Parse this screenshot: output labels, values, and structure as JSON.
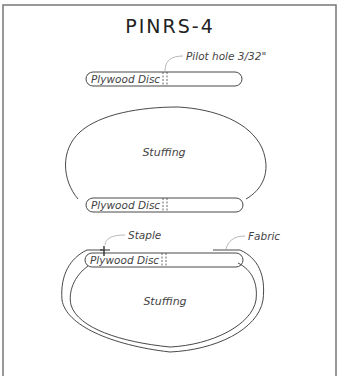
{
  "title": "PINRS-4",
  "figure_1": {
    "disc_label": "Plywood Disc",
    "callout": "Pilot hole 3/32\""
  },
  "figure_2": {
    "fill_label": "Stuffing",
    "disc_label": "Plywood Disc"
  },
  "figure_3": {
    "staple_label": "Staple",
    "fabric_label": "Fabric",
    "disc_label": "Plywood Disc",
    "fill_label": "Stuffing"
  },
  "colors": {
    "line": "#333333",
    "frame": "#777777",
    "background": "#ffffff"
  }
}
